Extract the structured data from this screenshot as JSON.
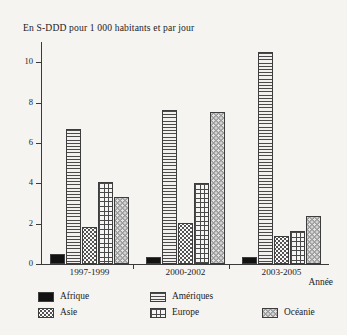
{
  "chart_data": {
    "type": "bar",
    "title": "En S-DDD pour 1 000 habitants et par jour",
    "xlabel": "Année",
    "ylabel": "",
    "grid": false,
    "legend_position": "bottom",
    "categories": [
      "1997-1999",
      "2000-2002",
      "2003-2005"
    ],
    "ylim": [
      0,
      11
    ],
    "yticks": [
      0,
      2,
      4,
      6,
      8,
      10
    ],
    "ytick_labels": [
      "0",
      "2",
      "4",
      "6",
      "8",
      "10"
    ],
    "series": [
      {
        "name": "Afrique",
        "pattern": "solid-black",
        "values": [
          0.5,
          0.35,
          0.35
        ]
      },
      {
        "name": "Amériques",
        "pattern": "horizontal-lines",
        "values": [
          6.7,
          7.65,
          10.5
        ]
      },
      {
        "name": "Asie",
        "pattern": "dotted",
        "values": [
          1.85,
          2.05,
          1.4
        ]
      },
      {
        "name": "Europe",
        "pattern": "crosshatch-grid",
        "values": [
          4.05,
          4.0,
          1.65
        ]
      },
      {
        "name": "Océanie",
        "pattern": "gray-dotted",
        "values": [
          3.3,
          7.55,
          2.4
        ]
      }
    ]
  },
  "colors": {
    "background": "#f6f4f1",
    "axis": "#3a3a3a",
    "text": "#222222",
    "afrique": "#121212",
    "oceanie": "#9a9a9a"
  }
}
